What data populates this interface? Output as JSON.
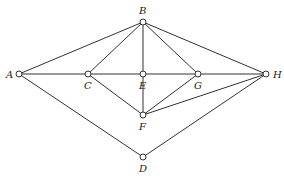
{
  "diagram": {
    "type": "graph",
    "nodes": [
      {
        "id": "A",
        "label": "A",
        "x": 19,
        "y": 74,
        "lx": 6,
        "ly": 78
      },
      {
        "id": "B",
        "label": "B",
        "x": 143,
        "y": 22,
        "lx": 139,
        "ly": 14
      },
      {
        "id": "C",
        "label": "C",
        "x": 88,
        "y": 74,
        "lx": 84,
        "ly": 89
      },
      {
        "id": "E",
        "label": "E",
        "x": 143,
        "y": 74,
        "lx": 139,
        "ly": 89
      },
      {
        "id": "G",
        "label": "G",
        "x": 198,
        "y": 74,
        "lx": 194,
        "ly": 89
      },
      {
        "id": "H",
        "label": "H",
        "x": 266,
        "y": 74,
        "lx": 273,
        "ly": 78
      },
      {
        "id": "F",
        "label": "F",
        "x": 143,
        "y": 115,
        "lx": 139,
        "ly": 130
      },
      {
        "id": "D",
        "label": "D",
        "x": 143,
        "y": 157,
        "lx": 139,
        "ly": 172
      }
    ],
    "edges": [
      [
        "A",
        "B"
      ],
      [
        "A",
        "C"
      ],
      [
        "A",
        "D"
      ],
      [
        "B",
        "C"
      ],
      [
        "B",
        "E"
      ],
      [
        "B",
        "G"
      ],
      [
        "B",
        "H"
      ],
      [
        "C",
        "E"
      ],
      [
        "C",
        "F"
      ],
      [
        "E",
        "G"
      ],
      [
        "E",
        "F"
      ],
      [
        "G",
        "H"
      ],
      [
        "G",
        "F"
      ],
      [
        "H",
        "F"
      ],
      [
        "H",
        "D"
      ]
    ]
  }
}
